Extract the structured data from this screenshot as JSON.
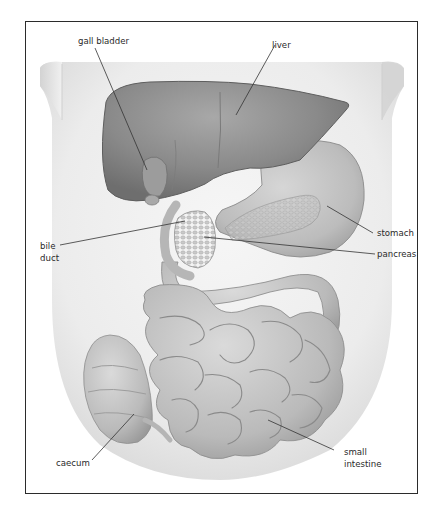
{
  "header": {
    "cut_off_text": "[text cut off at top edge]"
  },
  "diagram": {
    "style": "grayscale illustration",
    "labels": {
      "gall_bladder": "gall bladder",
      "liver": "liver",
      "stomach": "stomach",
      "bile_duct_line1": "bile",
      "bile_duct_line2": "duct",
      "pancreas": "pancreas",
      "caecum": "caecum",
      "small_intestine_line1": "small",
      "small_intestine_line2": "intestine"
    },
    "colors": {
      "frame": "#2b2b2b",
      "torso": "#e9e9e9",
      "liver": "#8c8c8c",
      "stomach": "#c4c4c4",
      "pancreas": "#b2b2b2",
      "intestine": "#bdbdbd",
      "leader_line": "#333333",
      "label_text": "#2a2a2a"
    }
  }
}
